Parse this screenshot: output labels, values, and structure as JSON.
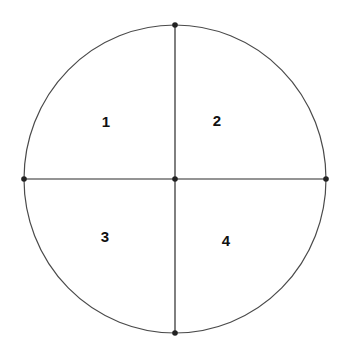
{
  "diagram": {
    "colors": {
      "background": "#ffffff",
      "outline": "#4a4a4a",
      "lines": "#2a2a2a",
      "points": "#222222",
      "labels": "#111111"
    },
    "circle": {
      "cx": 175,
      "cy": 179,
      "rx": 151,
      "ry": 154
    },
    "points": [
      {
        "name": "top",
        "x": 175,
        "y": 25
      },
      {
        "name": "left",
        "x": 24,
        "y": 179
      },
      {
        "name": "center",
        "x": 175,
        "y": 179
      },
      {
        "name": "right",
        "x": 326,
        "y": 179
      },
      {
        "name": "bottom",
        "x": 175,
        "y": 333
      }
    ],
    "quadrants": [
      {
        "label": "1",
        "x": 106,
        "y": 127
      },
      {
        "label": "2",
        "x": 217,
        "y": 126
      },
      {
        "label": "3",
        "x": 105,
        "y": 242
      },
      {
        "label": "4",
        "x": 226,
        "y": 246
      }
    ]
  }
}
